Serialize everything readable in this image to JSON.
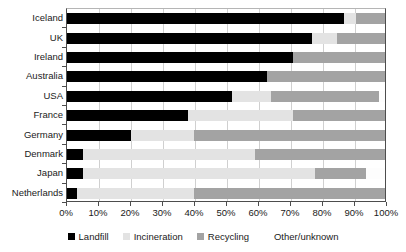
{
  "chart_data": {
    "type": "bar",
    "orientation": "horizontal",
    "stacked": true,
    "stacked_percent": true,
    "title": "",
    "subtitle": "",
    "xlabel": "",
    "ylabel": "",
    "xlim": [
      0,
      100
    ],
    "xticks": [
      0,
      10,
      20,
      30,
      40,
      50,
      60,
      70,
      80,
      90,
      100
    ],
    "xtick_labels": [
      "0%",
      "10%",
      "20%",
      "30%",
      "40%",
      "50%",
      "60%",
      "70%",
      "80%",
      "90%",
      "100%"
    ],
    "grid": true,
    "grid_axis": "x",
    "legend_position": "bottom",
    "categories": [
      "Iceland",
      "UK",
      "Ireland",
      "Australia",
      "USA",
      "France",
      "Germany",
      "Denmark",
      "Japan",
      "Netherlands"
    ],
    "series": [
      {
        "name": "Landfill",
        "color": "#000000",
        "values": [
          87,
          77,
          71,
          63,
          52,
          38,
          20,
          5,
          5,
          3
        ]
      },
      {
        "name": "Incineration",
        "color": "#e3e3e3",
        "values": [
          4,
          8,
          0,
          0,
          12,
          33,
          20,
          54,
          73,
          37
        ]
      },
      {
        "name": "Recycling",
        "color": "#a3a3a3",
        "values": [
          9,
          15,
          29,
          37,
          34,
          29,
          60,
          41,
          16,
          60
        ]
      },
      {
        "name": "Other/unknown",
        "color": "#fdfdfd",
        "values": [
          0,
          0,
          0,
          0,
          2,
          0,
          0,
          0,
          6,
          0
        ]
      }
    ]
  },
  "legend": {
    "items": [
      {
        "label": "Landfill",
        "color": "#000000"
      },
      {
        "label": "Incineration",
        "color": "#e3e3e3"
      },
      {
        "label": "Recycling",
        "color": "#a3a3a3"
      },
      {
        "label": "Other/unknown",
        "color": "#ffffff"
      }
    ]
  }
}
